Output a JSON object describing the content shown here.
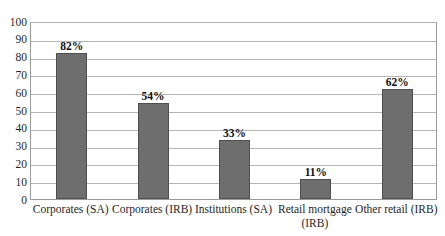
{
  "chart_data": {
    "type": "bar",
    "title": "",
    "subtitle": "",
    "xlabel": "",
    "ylabel": "",
    "ylim": [
      0,
      100
    ],
    "ytick_step": 10,
    "yticks": [
      "100",
      "90",
      "80",
      "70",
      "60",
      "50",
      "40",
      "30",
      "20",
      "10",
      "0"
    ],
    "grid": true,
    "legend": "none",
    "categories": [
      "Corporates (SA)",
      "Corporates (IRB)",
      "Institutions (SA)",
      "Retail mortgage (IRB)",
      "Other retail (IRB)"
    ],
    "category_lines": [
      [
        "Corporates (SA)"
      ],
      [
        "Corporates (IRB)"
      ],
      [
        "Institutions (SA)"
      ],
      [
        "Retail mortgage",
        "(IRB)"
      ],
      [
        "Other retail (IRB)"
      ]
    ],
    "values": [
      82,
      54,
      33,
      11,
      62
    ],
    "data_labels": [
      "82%",
      "54%",
      "33%",
      "11%",
      "62%"
    ],
    "colors": {
      "bar_fill": "#6e6e6e",
      "bar_border": "#4f4f4f",
      "gridline": "#b6b6b6",
      "plot_border": "#9a9a9a",
      "text": "#1f1f1f",
      "background": "#ffffff"
    }
  }
}
